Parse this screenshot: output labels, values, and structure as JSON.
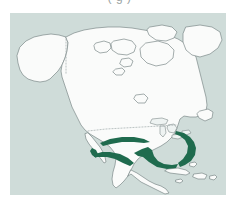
{
  "figure": {
    "caption": "(   g            )",
    "caption_note": "caption cropped at top edge; glyph tails only"
  },
  "map": {
    "title": "North America species distribution map",
    "projection_region": "North America",
    "colors": {
      "ocean_background": "#cfdcd9",
      "land_fill": "#fafbfa",
      "coastline_stroke": "#7d8a8a",
      "border_dotted": "#a9b4b4",
      "range_fill": "#1f6b4e",
      "page_background": "#ffffff"
    },
    "features": {
      "landmasses": [
        "Alaska",
        "Canada",
        "Canadian Arctic Archipelago",
        "Greenland edge",
        "Contiguous United States",
        "Mexico",
        "Baja California",
        "Central America",
        "Caribbean islands",
        "Cuba",
        "Hispaniola",
        "Newfoundland",
        "Great Lakes"
      ],
      "political_borders": [
        {
          "name": "Alaska-Canada border",
          "style": "dotted",
          "orientation": "vertical"
        },
        {
          "name": "United States-Canada border",
          "style": "dotted",
          "orientation": "horizontal"
        }
      ]
    },
    "range_bands": [
      {
        "name": "Southwestern United States band",
        "region": "Arizona to Texas",
        "shade": "#1f6b4e"
      },
      {
        "name": "Sierra Madre Occidental band",
        "region": "Northwestern Mexico",
        "shade": "#1f6b4e"
      },
      {
        "name": "Gulf Coast band",
        "region": "Texas to Louisiana coast",
        "shade": "#1f6b4e"
      },
      {
        "name": "Atlantic Coastal Plain band",
        "region": "Southeastern United States seaboard",
        "shade": "#1f6b4e"
      }
    ]
  }
}
